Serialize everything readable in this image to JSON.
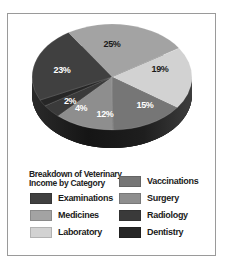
{
  "chart_data": {
    "type": "pie",
    "title": "Breakdown of Veterinary Income by Category",
    "title_lines": [
      "Breakdown of Veterinary",
      "Income by Category"
    ],
    "style": "3d",
    "slices": [
      {
        "label": "Medicines",
        "value": 25,
        "text": "25%",
        "color": "#a3a3a3",
        "label_color": "#1a1a1a"
      },
      {
        "label": "Laboratory",
        "value": 19,
        "text": "19%",
        "color": "#d2d2d2",
        "label_color": "#1a1a1a"
      },
      {
        "label": "Vaccinations",
        "value": 15,
        "text": "15%",
        "color": "#767676",
        "label_color": "#ffffff"
      },
      {
        "label": "Surgery",
        "value": 12,
        "text": "12%",
        "color": "#8e8e8e",
        "label_color": "#ffffff"
      },
      {
        "label": "Radiology",
        "value": 4,
        "text": "4%",
        "color": "#3a3a3a",
        "label_color": "#ffffff"
      },
      {
        "label": "Dentistry",
        "value": 2,
        "text": "2%",
        "color": "#262626",
        "label_color": "#ffffff"
      },
      {
        "label": "Examinations",
        "value": 23,
        "text": "23%",
        "color": "#404040",
        "label_color": "#ffffff"
      }
    ],
    "legend": {
      "position": "bottom",
      "columns": [
        [
          "Examinations",
          "Medicines",
          "Laboratory"
        ],
        [
          "Vaccinations",
          "Surgery",
          "Radiology",
          "Dentistry"
        ]
      ],
      "items": [
        {
          "label": "Examinations",
          "color": "#404040"
        },
        {
          "label": "Medicines",
          "color": "#a3a3a3"
        },
        {
          "label": "Laboratory",
          "color": "#d2d2d2"
        },
        {
          "label": "Vaccinations",
          "color": "#767676"
        },
        {
          "label": "Surgery",
          "color": "#8e8e8e"
        },
        {
          "label": "Radiology",
          "color": "#3a3a3a"
        },
        {
          "label": "Dentistry",
          "color": "#262626"
        }
      ]
    }
  },
  "legend": {
    "title_line1": "Breakdown of Veterinary",
    "title_line2": "Income by Category",
    "examinations": "Examinations",
    "medicines": "Medicines",
    "laboratory": "Laboratory",
    "vaccinations": "Vaccinations",
    "surgery": "Surgery",
    "radiology": "Radiology",
    "dentistry": "Dentistry"
  },
  "labels": {
    "medicines": "25%",
    "laboratory": "19%",
    "vaccinations": "15%",
    "surgery": "12%",
    "radiology": "4%",
    "dentistry": "2%",
    "examinations": "23%"
  },
  "colors": {
    "examinations": "#404040",
    "medicines": "#a3a3a3",
    "laboratory": "#d2d2d2",
    "vaccinations": "#767676",
    "surgery": "#8e8e8e",
    "radiology": "#3a3a3a",
    "dentistry": "#262626",
    "frame": "#9a9a9a"
  }
}
